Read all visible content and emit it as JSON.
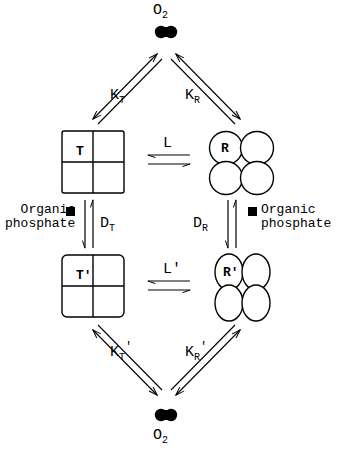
{
  "diagram": {
    "stroke_color": "#000000",
    "background": "#ffffff",
    "oxygen_top": {
      "label": "O",
      "subscript": "2",
      "symbol_name": "oxygen-dumbbell",
      "position": "top"
    },
    "oxygen_bottom": {
      "label": "O",
      "subscript": "2",
      "symbol_name": "oxygen-dumbbell",
      "position": "bottom"
    },
    "states": [
      {
        "id": "T",
        "label": "T",
        "shape": "squares",
        "position": "upper-left"
      },
      {
        "id": "R",
        "label": "R",
        "shape": "circles",
        "position": "upper-right"
      },
      {
        "id": "Tp",
        "label": "T'",
        "shape": "squares",
        "position": "lower-left"
      },
      {
        "id": "Rp",
        "label": "R'",
        "shape": "ellipses",
        "position": "lower-right"
      }
    ],
    "constants": {
      "k_t": {
        "base": "K",
        "sub": "T",
        "prime": ""
      },
      "k_r": {
        "base": "K",
        "sub": "R",
        "prime": ""
      },
      "k_t_prime": {
        "base": "K",
        "sub": "T",
        "prime": "'"
      },
      "k_r_prime": {
        "base": "K",
        "sub": "R",
        "prime": "'"
      },
      "l": {
        "base": "L",
        "prime": ""
      },
      "l_prime": {
        "base": "L",
        "prime": "'"
      },
      "d_t": {
        "base": "D",
        "sub": "T"
      },
      "d_r": {
        "base": "D",
        "sub": "R"
      }
    },
    "ligands": {
      "organic_phosphate_left": {
        "line1": "Organic",
        "line2": "phosphate",
        "marker": "square-marker"
      },
      "organic_phosphate_right": {
        "line1": "Organic",
        "line2": "phosphate",
        "marker": "square-marker"
      }
    }
  }
}
